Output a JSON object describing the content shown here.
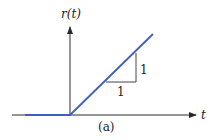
{
  "figure": {
    "caption": "(a)",
    "y_axis_label": "r(t)",
    "x_axis_label": "t",
    "slope_rise_label": "1",
    "slope_run_label": "1",
    "colors": {
      "axes": "#2a2a2a",
      "ramp": "#3f5fc0",
      "triangle": "#444444",
      "text": "#222222"
    }
  }
}
